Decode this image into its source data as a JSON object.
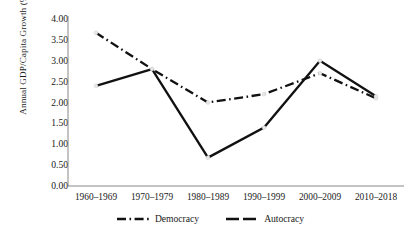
{
  "chart_data": {
    "type": "line",
    "title": "",
    "xlabel": "",
    "ylabel": "Annual GDP/Capita Growth (%)",
    "categories": [
      "1960–1969",
      "1970–1979",
      "1980–1989",
      "1990–1999",
      "2000–2009",
      "2010–2018"
    ],
    "series": [
      {
        "name": "Democracy",
        "style": "dash-dot",
        "color": "#111111",
        "values": [
          3.67,
          2.8,
          2.0,
          2.2,
          2.7,
          2.1
        ]
      },
      {
        "name": "Autocracy",
        "style": "solid",
        "color": "#111111",
        "values": [
          2.4,
          2.8,
          0.68,
          1.4,
          3.0,
          2.15
        ]
      }
    ],
    "ylim": [
      0.0,
      4.0
    ],
    "ytick_step": 0.5,
    "yticks": [
      "4.00",
      "3.50",
      "3.00",
      "2.50",
      "2.00",
      "1.50",
      "1.00",
      "0.50",
      "0.00"
    ],
    "ytick_values": [
      4.0,
      3.5,
      3.0,
      2.5,
      2.0,
      1.5,
      1.0,
      0.5,
      0.0
    ],
    "grid": false,
    "legend_position": "bottom",
    "legend": [
      "Democracy",
      "Autocracy"
    ]
  }
}
